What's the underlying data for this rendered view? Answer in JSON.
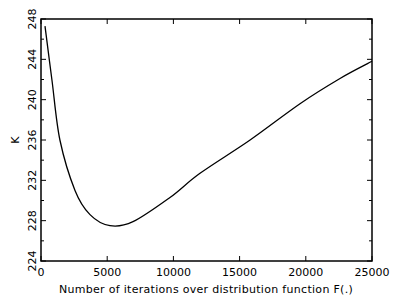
{
  "chart_data": {
    "type": "line",
    "title": "",
    "xlabel": "Number of iterations over distribution function F(.)",
    "ylabel": "K",
    "xlim": [
      0,
      25000
    ],
    "ylim": [
      224,
      248
    ],
    "xticks": [
      0,
      5000,
      10000,
      15000,
      20000,
      25000
    ],
    "xtick_labels": [
      "0",
      "5000",
      "10000",
      "15000",
      "20000",
      "25000"
    ],
    "yticks": [
      224,
      228,
      232,
      236,
      240,
      244,
      248
    ],
    "ytick_labels": [
      "224",
      "228",
      "232",
      "236",
      "240",
      "244",
      "248"
    ],
    "y_minor_step": 2,
    "x_minor_step": 2500,
    "grid": false,
    "legend": null,
    "series": [
      {
        "name": "K",
        "x": [
          300,
          830,
          1430,
          2570,
          3700,
          5210,
          6950,
          9740,
          12010,
          15790,
          19560,
          22580,
          25000
        ],
        "values": [
          247.3,
          241.9,
          236.0,
          231.0,
          228.6,
          227.5,
          227.9,
          230.3,
          232.7,
          236.0,
          239.6,
          242.1,
          243.8
        ]
      }
    ]
  }
}
